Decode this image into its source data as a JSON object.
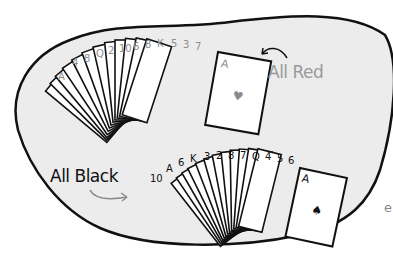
{
  "illustration": {
    "description": "Hand-drawn blob containing two fanned hands of playing cards",
    "top_hand": {
      "annotation": "All Red",
      "ranks": [
        "A",
        "4",
        "8",
        "Q",
        "2",
        "10",
        "6",
        "8",
        "K",
        "5",
        "3",
        "7",
        "A"
      ],
      "suits_color": "#8c8c8c"
    },
    "bottom_hand": {
      "annotation": "All Black",
      "ranks": [
        "10",
        "A",
        "6",
        "K",
        "3",
        "2",
        "8",
        "7",
        "Q",
        "4",
        "5",
        "6",
        "A"
      ],
      "suits_color": "#111111"
    },
    "stray_char": "e"
  },
  "colors": {
    "blob_fill": "#ececec",
    "outline": "#111111",
    "red_label": "#9a9a9a",
    "card_fill": "#ffffff"
  }
}
